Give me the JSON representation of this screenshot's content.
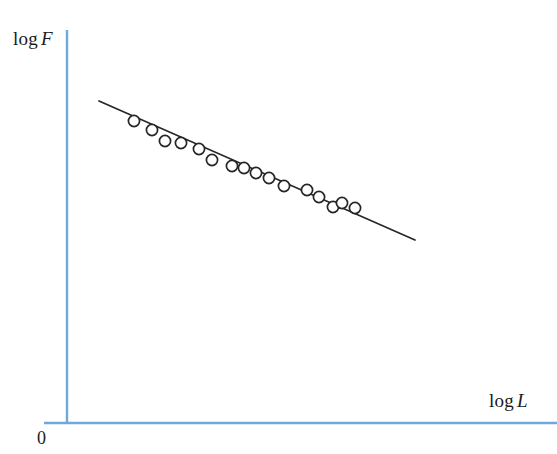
{
  "chart_data": {
    "type": "scatter",
    "title": "",
    "subtitle": "",
    "xlabel": "log L",
    "ylabel": "log F",
    "origin_label": "0",
    "xlabel_prefix": "log",
    "xlabel_var": "L",
    "ylabel_prefix": "log",
    "ylabel_var": "F",
    "grid": false,
    "legend": null,
    "annotations": [],
    "axis_color": "#6fa8dc",
    "marker_color": "#262626",
    "marker_fill": "#ffffff",
    "line_color": "#262626",
    "xlim": [
      0,
      1
    ],
    "ylim": [
      0,
      1
    ],
    "axes": {
      "x_axis_y_px": 423,
      "x_axis_x_start_px": 44,
      "x_axis_x_end_px": 557,
      "y_axis_x_px": 67,
      "y_axis_y_start_px": 30,
      "y_axis_y_end_px": 423
    },
    "series": [
      {
        "name": "observations",
        "marker": "open-circle",
        "points_px": [
          [
            134,
            121
          ],
          [
            152,
            130
          ],
          [
            165,
            141
          ],
          [
            181,
            143
          ],
          [
            199,
            149
          ],
          [
            212,
            160
          ],
          [
            232,
            166
          ],
          [
            244,
            168
          ],
          [
            256,
            173
          ],
          [
            269,
            178
          ],
          [
            284,
            186
          ],
          [
            307,
            190
          ],
          [
            319,
            197
          ],
          [
            333,
            207
          ],
          [
            342,
            203
          ],
          [
            355,
            208
          ]
        ]
      }
    ],
    "fit_line": {
      "name": "regression-line",
      "x1_px": 99,
      "y1_px": 101,
      "x2_px": 415,
      "y2_px": 240,
      "slope_sign": "negative"
    }
  }
}
